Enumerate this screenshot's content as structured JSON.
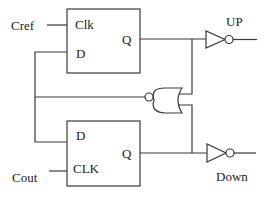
{
  "diagram": {
    "type": "digital logic circuit (phase-frequency detector)",
    "inputs": {
      "cref": "Cref",
      "cout": "Cout"
    },
    "outputs": {
      "up": "UP",
      "down": "Down"
    },
    "flipflop_top": {
      "clk": "Clk",
      "d": "D",
      "q": "Q"
    },
    "flipflop_bottom": {
      "d": "D",
      "clk": "CLK",
      "q": "Q"
    },
    "gates": [
      "D flip-flop",
      "D flip-flop",
      "NOR gate (inverted output)",
      "Inverter (UP)",
      "Inverter (Down)"
    ],
    "colors": {
      "line": "#3a3a3a",
      "text": "#222222",
      "background": "#ffffff"
    }
  }
}
